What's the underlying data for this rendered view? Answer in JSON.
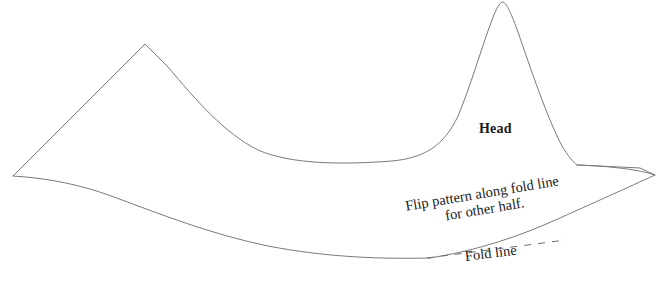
{
  "canvas": {
    "width": 659,
    "height": 281,
    "background": "#ffffff"
  },
  "style": {
    "outline_color": "#7a7a7a",
    "outline_width": 1,
    "fold_line_color": "#6f6f6f",
    "text_color": "#1a1a1a",
    "clipped_text_color": "#9a9a9a"
  },
  "labels": {
    "head": "Head",
    "flip_line1": "Flip pattern along fold line",
    "flip_line2": "for other half.",
    "fold_line": "Fold line",
    "clipped_top": "p g"
  },
  "geometry": {
    "outline_path": "M 13 176 L 145 44 L 168 67 C 196 100 224 133 258 150 C 290 164 340 165 392 161 C 424 158 444 146 458 116 C 470 88 482 46 492 20 C 496 9 500 2 503 2 C 507 3 512 16 518 32 C 530 67 548 120 562 146 C 568 156 573 162 577 165 L 640 168 L 655 175",
    "belly_path": "M 13 176 C 48 178 82 185 114 197 C 160 214 210 234 268 246 C 330 258 386 259 430 258",
    "fold_dash_path": "M 427 258 L 566 240",
    "tail_upper_path": "M 577 165 C 612 166 640 170 655 175 C 640 182 600 200 560 218 C 520 236 480 250 430 258",
    "dash_pattern": "7 7"
  },
  "annotations": [
    {
      "name": "head-label",
      "text": "Head",
      "x": 479,
      "y": 121,
      "bold": true,
      "rotation": 0
    },
    {
      "name": "flip-instruction-label",
      "text": "Flip pattern along fold line for other half.",
      "x": 404,
      "y": 198,
      "bold": false,
      "rotation": -9.5
    },
    {
      "name": "fold-line-label",
      "text": "Fold line",
      "x": 464,
      "y": 248,
      "bold": false,
      "rotation": -7
    }
  ]
}
